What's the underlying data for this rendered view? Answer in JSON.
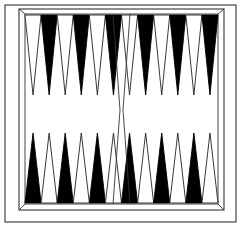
{
  "board": {
    "title": "Backgammon board",
    "colors": {
      "background": "#ffffff",
      "dark_point": "#000000",
      "light_point_stroke": "#222222",
      "frame": "#444444"
    },
    "outer_frame": {
      "x": 5,
      "y": 5,
      "w": 232,
      "h": 218
    },
    "inner_frame": {
      "x": 19,
      "y": 9,
      "w": 205,
      "h": 202
    },
    "playing_field": {
      "x": 25,
      "y": 14,
      "w": 193,
      "h": 190
    },
    "top_points": [
      {
        "index": 13,
        "color": "light"
      },
      {
        "index": 14,
        "color": "dark"
      },
      {
        "index": 15,
        "color": "light"
      },
      {
        "index": 16,
        "color": "dark"
      },
      {
        "index": 17,
        "color": "light"
      },
      {
        "index": 18,
        "color": "dark"
      },
      {
        "index": 19,
        "color": "light"
      },
      {
        "index": 20,
        "color": "dark"
      },
      {
        "index": 21,
        "color": "light"
      },
      {
        "index": 22,
        "color": "dark"
      },
      {
        "index": 23,
        "color": "light"
      },
      {
        "index": 24,
        "color": "dark"
      }
    ],
    "bottom_points": [
      {
        "index": 12,
        "color": "dark"
      },
      {
        "index": 11,
        "color": "light"
      },
      {
        "index": 10,
        "color": "dark"
      },
      {
        "index": 9,
        "color": "light"
      },
      {
        "index": 8,
        "color": "dark"
      },
      {
        "index": 7,
        "color": "light"
      },
      {
        "index": 6,
        "color": "dark"
      },
      {
        "index": 5,
        "color": "light"
      },
      {
        "index": 4,
        "color": "dark"
      },
      {
        "index": 3,
        "color": "light"
      },
      {
        "index": 2,
        "color": "dark"
      },
      {
        "index": 1,
        "color": "light"
      }
    ],
    "bar": {
      "label": "center bar"
    }
  }
}
